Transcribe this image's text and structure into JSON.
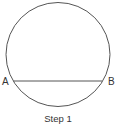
{
  "diagram": {
    "caption": "Step 1",
    "points": {
      "a": {
        "label": "A"
      },
      "b": {
        "label": "B"
      }
    },
    "shapes": {
      "circle": {
        "cx": 58,
        "cy": 54.5,
        "r": 52,
        "stroke": "#555555"
      },
      "chord": {
        "from": "A",
        "to": "B",
        "stroke": "#555555"
      }
    }
  }
}
